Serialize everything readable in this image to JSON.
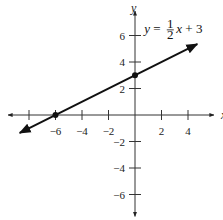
{
  "chart_data": {
    "type": "line",
    "title": "",
    "xlabel": "x",
    "ylabel": "y",
    "xlim": [
      -9.5,
      5.5
    ],
    "ylim": [
      -7.5,
      8
    ],
    "x_ticks": [
      -8,
      -6,
      -4,
      -2,
      2,
      4
    ],
    "x_tick_labels": [
      "-6",
      "-4",
      "-2",
      "2",
      "4"
    ],
    "x_tick_label_values": [
      -6,
      -4,
      -2,
      2,
      4
    ],
    "y_ticks": [
      6,
      4,
      2,
      -2,
      -4,
      -6
    ],
    "y_tick_labels": [
      "6",
      "4",
      "2",
      "-2",
      "-4",
      "-6"
    ],
    "grid": false,
    "series": [
      {
        "name": "y = 1/2 x + 3",
        "slope": 0.5,
        "intercept": 3,
        "x_range": [
          -8.7,
          4.7
        ],
        "arrows": "both"
      }
    ],
    "points": [
      {
        "x": 0,
        "y": 3,
        "label": "y-intercept"
      },
      {
        "x": -6,
        "y": 0,
        "label": "x-intercept"
      }
    ],
    "annotations": [
      {
        "text_parts": [
          "y",
          " = ",
          "1",
          "2",
          "x",
          " + 3"
        ],
        "x": 0.7,
        "y": 6.2
      }
    ]
  }
}
